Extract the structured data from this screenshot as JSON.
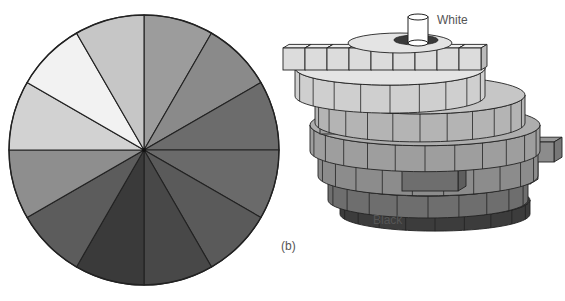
{
  "figure": {
    "panel_label": "(b)",
    "labels": {
      "top": "White",
      "bottom": "Black"
    }
  },
  "color_circle": {
    "sector_count": 12,
    "sectors": [
      {
        "index": 0,
        "color": "#9c9c9c"
      },
      {
        "index": 1,
        "color": "#8a8a8a"
      },
      {
        "index": 2,
        "color": "#6c6c6c"
      },
      {
        "index": 3,
        "color": "#6a6a6a"
      },
      {
        "index": 4,
        "color": "#5a5a5a"
      },
      {
        "index": 5,
        "color": "#484848"
      },
      {
        "index": 6,
        "color": "#3a3a3a"
      },
      {
        "index": 7,
        "color": "#343434"
      },
      {
        "index": 8,
        "color": "#5c5c5c"
      },
      {
        "index": 9,
        "color": "#8e8e8e"
      },
      {
        "index": 10,
        "color": "#d2d2d2"
      },
      {
        "index": 11,
        "color": "#f2f2f2"
      },
      {
        "index": 12,
        "color": "#c6c6c6"
      }
    ]
  },
  "color_solid": {
    "tiers": [
      {
        "name": "tier-1",
        "color": "#dcdcdc"
      },
      {
        "name": "tier-2",
        "color": "#cfcfcf"
      },
      {
        "name": "tier-3",
        "color": "#b4b4b4"
      },
      {
        "name": "tier-4",
        "color": "#9e9e9e"
      },
      {
        "name": "tier-5",
        "color": "#8c8c8c"
      },
      {
        "name": "tier-6",
        "color": "#6e6e6e"
      },
      {
        "name": "tier-7",
        "color": "#3c3c3c"
      }
    ],
    "axis_top_color": "#ffffff",
    "axis_bottom_color": "#1e1e1e"
  }
}
